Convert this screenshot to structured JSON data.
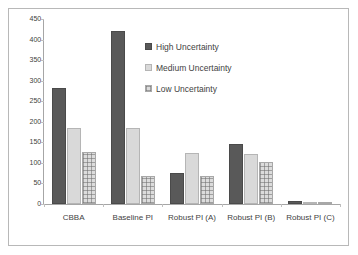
{
  "chart_data": {
    "type": "bar",
    "title": "",
    "subtitle": "",
    "xlabel": "",
    "ylabel": "",
    "categories": [
      "CBBA",
      "Baseline PI",
      "Robust PI (A)",
      "Robust PI (B)",
      "Robust PI (C)"
    ],
    "series": [
      {
        "name": "High Uncertainty",
        "values": [
          282,
          420,
          75,
          145,
          7
        ],
        "color": "#595959"
      },
      {
        "name": "Medium Uncertainty",
        "values": [
          185,
          185,
          125,
          122,
          2
        ],
        "color": "#D9D9D9"
      },
      {
        "name": "Low Uncertainty",
        "values": [
          127,
          68,
          67,
          102,
          4
        ],
        "color": "#DCDCDC"
      }
    ],
    "ylim": [
      0,
      450
    ],
    "yticks": [
      0,
      50,
      100,
      150,
      200,
      250,
      300,
      350,
      400,
      450
    ],
    "ytick_labels": [
      "0",
      "50",
      "100",
      "150",
      "200",
      "250",
      "300",
      "350",
      "400",
      "450"
    ],
    "grid": false,
    "legend_position": "inside-top-center",
    "legend": [
      "High Uncertainty",
      "Medium Uncertainty",
      "Low Uncertainty"
    ],
    "annotations": []
  },
  "colors": {
    "high_uncertainty": "#595959",
    "medium_uncertainty": "#D9D9D9",
    "low_uncertainty": "#DCDCDC",
    "axis": "#A6A6A6",
    "border": "#B8B8B8",
    "text": "#3F3F3F",
    "background": "#FFFFFF"
  }
}
